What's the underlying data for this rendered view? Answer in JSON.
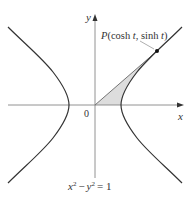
{
  "diagram": {
    "type": "hyperbola",
    "equation": {
      "x": "x",
      "x_exp": "2",
      "minus": "−",
      "y": "y",
      "y_exp": "2",
      "eq": "= 1"
    },
    "axes": {
      "x_label": "x",
      "y_label": "y",
      "origin_label": "0"
    },
    "point": {
      "label_P": "P",
      "label_open": "(cosh ",
      "label_t1": "t",
      "label_mid": ", sinh ",
      "label_t2": "t",
      "label_close": ")"
    },
    "colors": {
      "curve": "#333333",
      "axis": "#777777",
      "shaded_region": "#dddddd",
      "background": "#ffffff"
    }
  }
}
